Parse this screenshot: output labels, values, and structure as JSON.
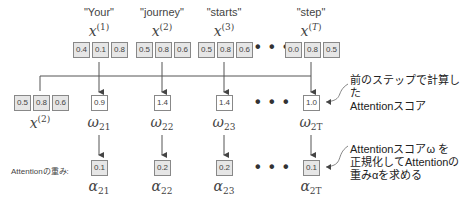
{
  "inputs": [
    {
      "word": "\"Your\"",
      "var": "x",
      "sup": "(1)",
      "sup_italic": false,
      "values": [
        "0.4",
        "0.1",
        "0.8"
      ]
    },
    {
      "word": "\"journey\"",
      "var": "x",
      "sup": "(2)",
      "sup_italic": false,
      "values": [
        "0.5",
        "0.8",
        "0.6"
      ]
    },
    {
      "word": "\"starts\"",
      "var": "x",
      "sup": "(3)",
      "sup_italic": false,
      "values": [
        "0.5",
        "0.8",
        "0.6"
      ]
    },
    {
      "word": "\"step\"",
      "var": "x",
      "sup": "T",
      "sup_italic": true,
      "values": [
        "0.0",
        "0.8",
        "0.5"
      ]
    }
  ],
  "query": {
    "var": "x",
    "sup": "(2)",
    "values": [
      "0.5",
      "0.8",
      "0.6"
    ]
  },
  "scores": [
    {
      "value": "0.9",
      "var": "ω",
      "sub": "21"
    },
    {
      "value": "1.4",
      "var": "ω",
      "sub": "22"
    },
    {
      "value": "1.4",
      "var": "ω",
      "sub": "23"
    },
    {
      "value": "1.0",
      "var": "ω",
      "sub": "2T"
    }
  ],
  "weights_label": "Attentionの重み:",
  "weights": [
    {
      "value": "0.1",
      "var": "α",
      "sub": "21"
    },
    {
      "value": "0.2",
      "var": "α",
      "sub": "22"
    },
    {
      "value": "0.2",
      "var": "α",
      "sub": "23"
    },
    {
      "value": "0.1",
      "var": "α",
      "sub": "2T"
    }
  ],
  "ellipsis": "• • •",
  "annotations": {
    "score_note": [
      "前のステップで計算した",
      "Attentionスコア"
    ],
    "weight_note": [
      "Attentionスコアω を",
      "正規化してAttentionの",
      "重みαを求める"
    ]
  },
  "colors": {
    "line": "#555555",
    "box_border": "#888888",
    "box_fill": "#e6e6e6",
    "text": "#333333"
  }
}
